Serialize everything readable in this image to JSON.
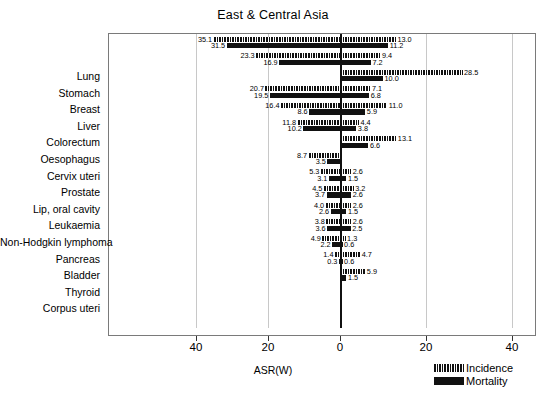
{
  "chart_data": {
    "type": "bar",
    "subtype": "diverging-population-pyramid",
    "title": "East & Central Asia",
    "xlabel": "ASR(W)",
    "ylabel": "",
    "left_group_label": "Men",
    "right_group_label": "Women",
    "xlim": [
      -40,
      40
    ],
    "xticks": [
      40,
      20,
      0,
      20,
      40
    ],
    "xtick_labels": [
      "40",
      "20",
      "0",
      "20",
      "40"
    ],
    "grid": true,
    "grid_axis": "x",
    "legend_position": "bottom-right",
    "legend": [
      {
        "name": "Incidence",
        "style": "hatched"
      },
      {
        "name": "Mortality",
        "style": "solid"
      }
    ],
    "categories": [
      "Lung",
      "Stomach",
      "Breast",
      "Liver",
      "Colorectum",
      "Oesophagus",
      "Cervix uteri",
      "Prostate",
      "Lip, oral cavity",
      "Leukaemia",
      "Non-Hodgkin lymphoma",
      "Pancreas",
      "Bladder",
      "Thyroid",
      "Corpus uteri"
    ],
    "series": [
      {
        "name": "Men Incidence",
        "side": "left",
        "measure": "Incidence",
        "values": [
          35.1,
          23.3,
          null,
          20.7,
          16.4,
          11.8,
          null,
          8.7,
          5.3,
          4.5,
          4.0,
          3.8,
          4.9,
          1.4,
          null
        ]
      },
      {
        "name": "Men Mortality",
        "side": "left",
        "measure": "Mortality",
        "values": [
          31.5,
          16.9,
          null,
          19.5,
          8.6,
          10.2,
          null,
          3.5,
          3.1,
          3.7,
          2.6,
          3.6,
          2.2,
          0.3,
          null
        ]
      },
      {
        "name": "Women Incidence",
        "side": "right",
        "measure": "Incidence",
        "values": [
          13.0,
          9.4,
          28.5,
          7.1,
          11.0,
          4.4,
          13.1,
          null,
          2.6,
          3.2,
          2.6,
          2.6,
          1.3,
          4.7,
          5.9
        ]
      },
      {
        "name": "Women Mortality",
        "side": "right",
        "measure": "Mortality",
        "values": [
          11.2,
          7.2,
          10.0,
          6.8,
          5.9,
          3.8,
          6.6,
          null,
          1.5,
          2.6,
          1.5,
          2.5,
          0.6,
          0.6,
          1.5
        ]
      }
    ],
    "colors": {
      "bar": "#111111",
      "gridline": "#c8c8c8",
      "axis": "#7a7a7a",
      "zero_axis": "#111111",
      "background": "#ffffff"
    }
  }
}
